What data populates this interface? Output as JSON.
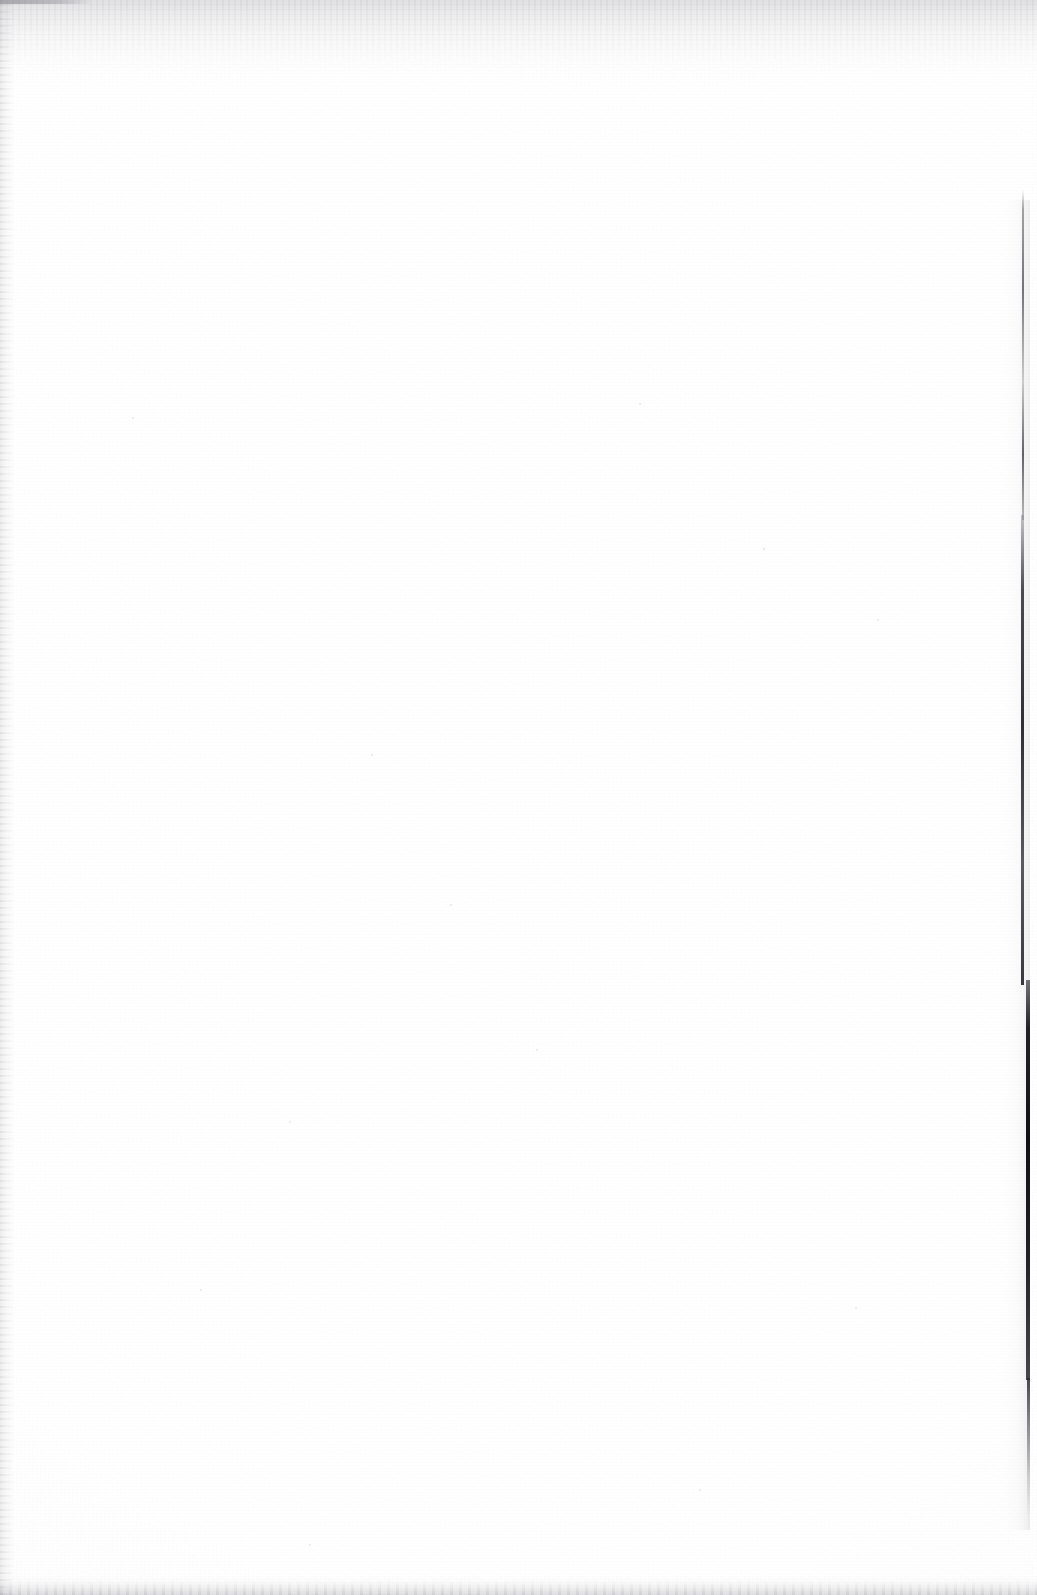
{
  "document": {
    "kind": "scanned-page",
    "page_state": "blank",
    "visible_text": "",
    "width_px": 1037,
    "height_px": 1595
  },
  "colors": {
    "paper": "#ffffff",
    "grain": "#f7f7f8",
    "edge_shadow": "#8e8e96",
    "gutter_line": "#141418"
  },
  "artifacts": {
    "top_edge_band": {
      "name": "top-scan-shadow",
      "y_start_px": 0,
      "y_end_px": 78
    },
    "left_edge_band": {
      "name": "left-scan-texture",
      "x_start_px": 0,
      "x_end_px": 14
    },
    "bottom_edge_band": {
      "name": "bottom-scan-smudge",
      "y_start_px": 1575,
      "y_end_px": 1595
    },
    "corner_mark": {
      "name": "top-left-corner-mark",
      "x_px": 0,
      "y_px": 0,
      "width_px": 92,
      "height_px": 4
    },
    "gutter_line": {
      "name": "right-gutter-line",
      "x_px": 1022,
      "y_start_px": 190,
      "y_end_px": 1538,
      "description": "thin grey at top, thick and near-black toward the lower third, fading out before the bottom edge"
    },
    "specks": [
      {
        "x": 133,
        "y": 418,
        "r": 1.4
      },
      {
        "x": 372,
        "y": 755,
        "r": 1.1
      },
      {
        "x": 764,
        "y": 549,
        "r": 1.3
      },
      {
        "x": 640,
        "y": 404,
        "r": 1.2
      },
      {
        "x": 878,
        "y": 620,
        "r": 1.0
      },
      {
        "x": 290,
        "y": 1122,
        "r": 1.2
      },
      {
        "x": 537,
        "y": 1050,
        "r": 1.1
      },
      {
        "x": 201,
        "y": 1290,
        "r": 1.3
      },
      {
        "x": 856,
        "y": 1308,
        "r": 1.0
      },
      {
        "x": 451,
        "y": 905,
        "r": 1.1
      },
      {
        "x": 700,
        "y": 1490,
        "r": 1.2
      },
      {
        "x": 310,
        "y": 1545,
        "r": 1.0
      }
    ]
  }
}
